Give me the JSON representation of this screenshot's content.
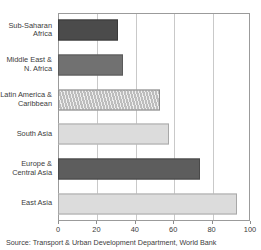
{
  "chart_data": {
    "type": "bar",
    "orientation": "horizontal",
    "title": "",
    "xlabel": "",
    "ylabel": "",
    "xlim": [
      0,
      100
    ],
    "xticks": [
      "0",
      "20",
      "40",
      "60",
      "80",
      "100"
    ],
    "grid": true,
    "legend": "none",
    "categories": [
      "Sub-Saharan\nAfrica",
      "Middle East &\nN. Africa",
      "Latin America &\nCaribbean",
      "South Asia",
      "Europe &\nCentral Asia",
      "East Asia"
    ],
    "values": [
      31,
      34,
      53,
      58,
      74,
      93
    ],
    "bar_styles": [
      "dark",
      "medium",
      "hatch",
      "light",
      "darkmed",
      "light"
    ],
    "colors": {
      "dark": "#4b4b4b",
      "medium": "#717171",
      "darkmed": "#5d5d5d",
      "light": "#dcdcdc",
      "hatch": "#bdbdbd",
      "frame": "#9b9b9b",
      "gridline": "#c9c9c9",
      "text": "#3b3b3b"
    }
  },
  "source": {
    "note": "Source: Transport & Urban Development Department, World Bank"
  },
  "title_clipped": ""
}
